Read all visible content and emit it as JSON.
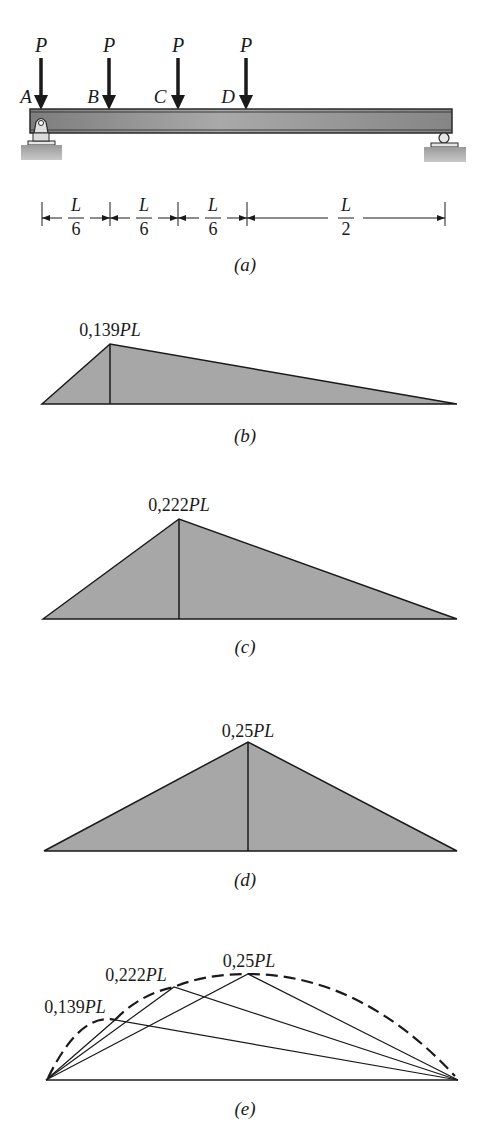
{
  "figure": {
    "a": {
      "caption": "(a)",
      "load_label": "P",
      "points": [
        "A",
        "B",
        "C",
        "D"
      ],
      "dimensions": [
        {
          "num": "L",
          "den": "6"
        },
        {
          "num": "L",
          "den": "6"
        },
        {
          "num": "L",
          "den": "6"
        },
        {
          "num": "L",
          "den": "2"
        }
      ]
    },
    "b": {
      "caption": "(b)",
      "peak_value": "0,139",
      "peak_unit": "PL"
    },
    "c": {
      "caption": "(c)",
      "peak_value": "0,222",
      "peak_unit": "PL"
    },
    "d": {
      "caption": "(d)",
      "peak_value": "0,25",
      "peak_unit": "PL"
    },
    "e": {
      "caption": "(e)",
      "labels": [
        {
          "value": "0,139",
          "unit": "PL"
        },
        {
          "value": "0,222",
          "unit": "PL"
        },
        {
          "value": "0,25",
          "unit": "PL"
        }
      ]
    }
  },
  "colors": {
    "fill": "#a7a7a7",
    "stroke": "#1a1a1a",
    "beam": "#8f8f8f",
    "ground": "#8a8a8a"
  }
}
